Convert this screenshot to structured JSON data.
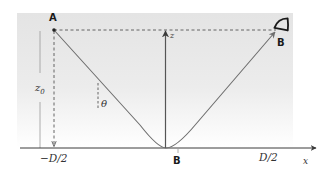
{
  "figure": {
    "type": "ray-diagram",
    "colors": {
      "background_top": "#e4e4e4",
      "background_bottom": "#ffffff",
      "ray": "#6e6e6e",
      "axis": "#3a3a3a",
      "dashed": "#555555",
      "bracket": "#9a9a9a"
    }
  },
  "labels": {
    "point_a": "A",
    "observer_b": "B",
    "ground_b": "B",
    "z_axis": "z",
    "x_axis": "x",
    "height": "z",
    "height_sub": "0",
    "angle": "θ",
    "left_tick": "−D/2",
    "right_tick": "D/2"
  },
  "icons": {
    "observer": "eye-icon"
  }
}
